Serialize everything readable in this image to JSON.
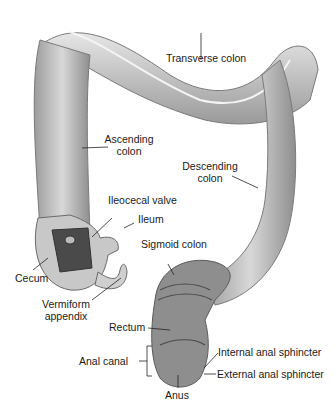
{
  "labels": {
    "transverse_colon": "Transverse colon",
    "ascending_colon_1": "Ascending",
    "ascending_colon_2": "colon",
    "descending_colon_1": "Descending",
    "descending_colon_2": "colon",
    "ileocecal_valve": "Ileocecal valve",
    "ileum": "Ileum",
    "sigmoid_colon": "Sigmoid colon",
    "cecum": "Cecum",
    "vermiform_appendix_1": "Vermiform",
    "vermiform_appendix_2": "appendix",
    "rectum": "Rectum",
    "anal_canal": "Anal canal",
    "internal_anal_sphincter": "Internal anal sphincter",
    "external_anal_sphincter": "External anal sphincter",
    "anus": "Anus"
  },
  "colors": {
    "tissue_light": "#d9d9d9",
    "tissue_mid": "#a8a8a8",
    "tissue_dark": "#5a5a5a",
    "label_text": "#1a1a1a"
  }
}
